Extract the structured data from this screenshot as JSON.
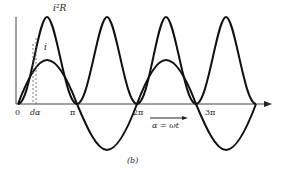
{
  "figure": {
    "caption": "(b)",
    "curves": [
      {
        "name": "power",
        "label": "i²R"
      },
      {
        "name": "current",
        "label": "i"
      }
    ],
    "x_ticks": [
      "0",
      "dα",
      "π",
      "2π",
      "3π"
    ],
    "x_axis_label": "α = ωt"
  }
}
